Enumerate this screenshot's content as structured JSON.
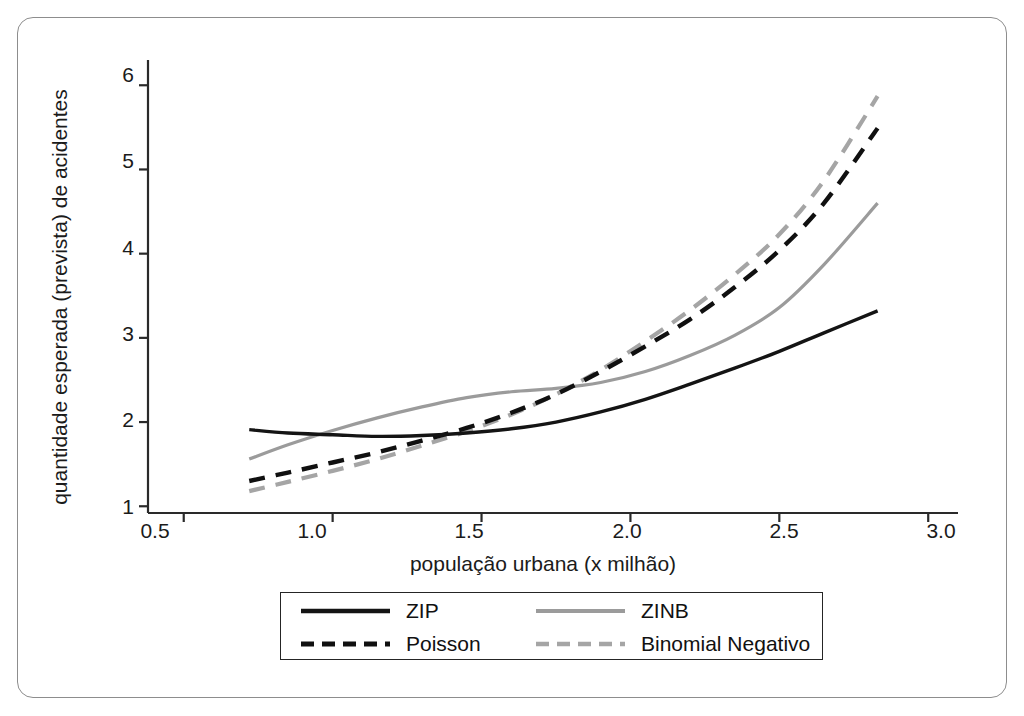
{
  "chart_data": {
    "type": "line",
    "title": "",
    "xlabel": "população urbana (x milhão)",
    "ylabel": "quantidade esperada (prevista) de acidentes",
    "xlim": [
      0.38,
      3.1
    ],
    "ylim": [
      0.92,
      6.3
    ],
    "xticks": [
      "0.5",
      "1.0",
      "1.5",
      "2.0",
      "2.5",
      "3.0"
    ],
    "xtick_values": [
      0.5,
      1.0,
      1.5,
      2.0,
      2.5,
      3.0
    ],
    "yticks": [
      "1",
      "2",
      "3",
      "4",
      "5",
      "6"
    ],
    "ytick_values": [
      1,
      2,
      3,
      4,
      5,
      6
    ],
    "grid": false,
    "legend_position": "below-axes",
    "x": [
      0.72,
      0.85,
      1.0,
      1.15,
      1.3,
      1.45,
      1.6,
      1.75,
      1.9,
      2.05,
      2.2,
      2.35,
      2.5,
      2.65,
      2.83
    ],
    "series": [
      {
        "name": "ZIP",
        "color": "#141414",
        "style": "solid",
        "width": 3.4,
        "values": [
          1.91,
          1.87,
          1.85,
          1.83,
          1.84,
          1.87,
          1.92,
          2.0,
          2.12,
          2.27,
          2.45,
          2.64,
          2.84,
          3.06,
          3.32
        ]
      },
      {
        "name": "ZINB",
        "color": "#9b9b9b",
        "style": "solid",
        "width": 3.2,
        "values": [
          1.56,
          1.73,
          1.9,
          2.05,
          2.18,
          2.29,
          2.36,
          2.4,
          2.47,
          2.6,
          2.79,
          3.03,
          3.36,
          3.87,
          4.6
        ]
      },
      {
        "name": "Poisson",
        "color": "#101010",
        "style": "dashed",
        "width": 4.4,
        "values": [
          1.3,
          1.4,
          1.52,
          1.64,
          1.78,
          1.93,
          2.11,
          2.33,
          2.6,
          2.9,
          3.22,
          3.6,
          4.04,
          4.6,
          5.49
        ]
      },
      {
        "name": "Binomial Negativo",
        "color": "#a5a5a5",
        "style": "dashed",
        "width": 4.2,
        "values": [
          1.18,
          1.29,
          1.42,
          1.56,
          1.72,
          1.89,
          2.09,
          2.33,
          2.62,
          2.96,
          3.33,
          3.75,
          4.23,
          4.87,
          5.87
        ]
      }
    ]
  },
  "axes": {
    "x_axis_pixel": {
      "x0": 148,
      "x1": 958,
      "y": 513
    },
    "y_axis_pixel": {
      "y0": 513,
      "y1": 60,
      "x": 148
    }
  },
  "legend": {
    "entries": [
      {
        "label": "ZIP",
        "series": "ZIP"
      },
      {
        "label": "ZINB",
        "series": "ZINB"
      },
      {
        "label": "Poisson",
        "series": "Poisson"
      },
      {
        "label": "Binomial Negativo",
        "series": "Binomial Negativo"
      }
    ]
  },
  "colors": {
    "frame": "#8d8d8d",
    "axis": "#2a2a2a",
    "text": "#1b1b1b",
    "background": "#ffffff"
  }
}
